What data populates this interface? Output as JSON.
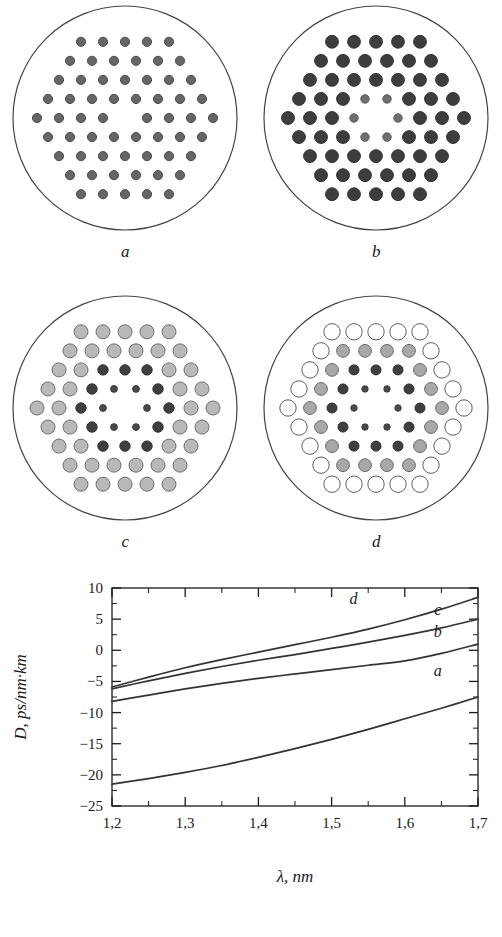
{
  "figure": {
    "panels": [
      {
        "id": "a",
        "caption": "a",
        "description": "uniform hexagonal array of identical small gray holes with one missing central hole",
        "cladding_radius": 112,
        "rows": [
          5,
          6,
          7,
          8,
          9,
          8,
          7,
          6,
          5
        ],
        "missing_center": true,
        "zones": [
          {
            "ring": "all",
            "radius": 4.6,
            "fill": "#666666",
            "stroke": "#4d4d4d"
          }
        ]
      },
      {
        "id": "b",
        "caption": "b",
        "description": "hexagonal array of large dark holes, the six holes around the missing centre are reduced and lighter",
        "cladding_radius": 112,
        "rows": [
          5,
          6,
          7,
          8,
          9,
          8,
          7,
          6,
          5
        ],
        "missing_center": true,
        "zones": [
          {
            "ring": "1",
            "radius": 4.2,
            "fill": "#6f6f6f",
            "stroke": "#5a5a5a"
          },
          {
            "ring": "outer",
            "radius": 6.4,
            "fill": "#3d3d3d",
            "stroke": "#2e2e2e"
          }
        ]
      },
      {
        "id": "c",
        "caption": "c",
        "description": "graded array: large light gray holes outside, dark medium holes in the middle ring, small dark holes nearest the core",
        "cladding_radius": 112,
        "rows": [
          5,
          6,
          7,
          8,
          9,
          8,
          7,
          6,
          5
        ],
        "missing_center": true,
        "zones": [
          {
            "ring": "1",
            "radius": 3.4,
            "fill": "#4a4a4a",
            "stroke": "#3a3a3a"
          },
          {
            "ring": "2",
            "radius": 5.2,
            "fill": "#3f3f3f",
            "stroke": "#303030"
          },
          {
            "ring": "outer",
            "radius": 7.0,
            "fill": "#b9b9b9",
            "stroke": "#6e6e6e"
          }
        ]
      },
      {
        "id": "d",
        "caption": "d",
        "description": "fully graded array: hollow white large holes outside, gray holes, dark holes, smallest dark holes at the core",
        "cladding_radius": 112,
        "rows": [
          5,
          6,
          7,
          8,
          9,
          8,
          7,
          6,
          5
        ],
        "missing_center": true,
        "zones": [
          {
            "ring": "1",
            "radius": 3.2,
            "fill": "#4a4a4a",
            "stroke": "#3a3a3a"
          },
          {
            "ring": "2",
            "radius": 5.0,
            "fill": "#3f3f3f",
            "stroke": "#303030"
          },
          {
            "ring": "3",
            "radius": 6.4,
            "fill": "#a8a8a8",
            "stroke": "#6a6a6a"
          },
          {
            "ring": "outer",
            "radius": 8.2,
            "fill": "#ffffff",
            "stroke": "#5f5f5f"
          }
        ]
      }
    ]
  },
  "chart_data": {
    "type": "line",
    "title": "",
    "xlabel": "λ, nm",
    "ylabel": "D, ps/nm·km",
    "xlim": [
      1.2,
      1.7
    ],
    "ylim": [
      -25,
      10
    ],
    "grid": false,
    "legend": "inline-curve-labels",
    "x_tick_labels": [
      "1,2",
      "1,3",
      "1,4",
      "1,5",
      "1,6",
      "1,7"
    ],
    "x_ticks": [
      1.2,
      1.3,
      1.4,
      1.5,
      1.6,
      1.7
    ],
    "x_minor_step": 0.05,
    "y_tick_labels": [
      "10",
      "5",
      "0",
      "−5",
      "−10",
      "−15",
      "−20",
      "−25"
    ],
    "y_ticks": [
      10,
      5,
      0,
      -5,
      -10,
      -15,
      -20,
      -25
    ],
    "y_minor_step": 2.5,
    "x": [
      1.2,
      1.25,
      1.3,
      1.35,
      1.4,
      1.45,
      1.5,
      1.55,
      1.6,
      1.65,
      1.7
    ],
    "series": [
      {
        "name": "a",
        "label": "a",
        "color": "#333333",
        "values": [
          -21.5,
          -20.6,
          -19.6,
          -18.5,
          -17.2,
          -15.8,
          -14.3,
          -12.7,
          -11.0,
          -9.3,
          -7.5
        ]
      },
      {
        "name": "b",
        "label": "b",
        "color": "#333333",
        "values": [
          -8.2,
          -7.2,
          -6.2,
          -5.3,
          -4.5,
          -3.8,
          -3.1,
          -2.4,
          -1.7,
          -0.5,
          1.0
        ]
      },
      {
        "name": "c",
        "label": "c",
        "color": "#333333",
        "values": [
          -6.2,
          -4.9,
          -3.7,
          -2.6,
          -1.6,
          -0.7,
          0.3,
          1.3,
          2.4,
          3.6,
          5.0
        ]
      },
      {
        "name": "d",
        "label": "d",
        "color": "#333333",
        "values": [
          -5.9,
          -4.3,
          -2.8,
          -1.5,
          -0.3,
          0.9,
          2.1,
          3.4,
          4.9,
          6.6,
          8.5
        ]
      }
    ],
    "curve_label_positions": [
      {
        "name": "d",
        "x": 1.53,
        "y": 7.4
      },
      {
        "name": "c",
        "x": 1.645,
        "y": 5.6
      },
      {
        "name": "b",
        "x": 1.645,
        "y": 2.2
      },
      {
        "name": "a",
        "x": 1.645,
        "y": -4.2
      }
    ]
  }
}
